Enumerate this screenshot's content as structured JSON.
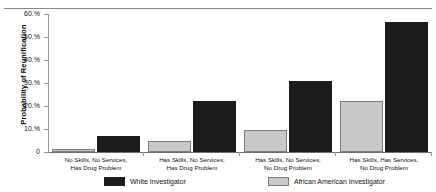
{
  "chart_data": {
    "type": "bar",
    "title": "",
    "xlabel": "",
    "ylabel": "Probability of Reunification",
    "ylim": [
      0,
      60
    ],
    "grid": false,
    "legend_position": "bottom",
    "ytick_labels": [
      "60.%",
      "50.%",
      "40.%",
      "30.%",
      "20.%",
      "10.%",
      "0"
    ],
    "ytick_values": [
      60,
      50,
      40,
      30,
      20,
      10,
      0
    ],
    "categories": [
      "No Skills, No Services,\nHas Drug Problem",
      "Has Skills, No Services,\nHas Drug Problem",
      "Has Skills, No Services,\nNo Drug Problem",
      "Has Skills, Has Services,\nNo Drug Problem"
    ],
    "category_lines": [
      [
        "No Skills, No Services,",
        "Has Drug Problem"
      ],
      [
        "Has Skills, No Services,",
        "Has Drug Problem"
      ],
      [
        "Has Skills, No Services,",
        "No Drug Problem"
      ],
      [
        "Has Skills, Has Services,",
        "No Drug Problem"
      ]
    ],
    "series": [
      {
        "name": "African American Investigator",
        "color": "#c8c8c8",
        "values": [
          1.5,
          5.0,
          9.5,
          22.0
        ]
      },
      {
        "name": "White Investigator",
        "color": "#1c1c1c",
        "values": [
          7.0,
          22.0,
          31.0,
          56.5
        ]
      }
    ]
  },
  "legend": {
    "items": [
      {
        "label": "White Investigator",
        "swatch": "black"
      },
      {
        "label": "African American Investigator",
        "swatch": "gray"
      }
    ]
  }
}
